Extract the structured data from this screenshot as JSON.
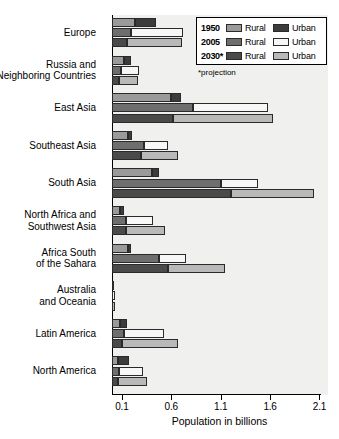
{
  "chart_data": {
    "type": "bar",
    "orientation": "horizontal",
    "title": "",
    "xlabel": "Population in billions",
    "ylabel": "",
    "xlim": [
      0.0,
      2.15
    ],
    "xticks": [
      0.1,
      0.6,
      1.1,
      1.6,
      2.1
    ],
    "xticklabels": [
      "0.1",
      "0.6",
      "1.1",
      "1.6",
      "2.1"
    ],
    "grid": false,
    "legend_position": "top-right",
    "stacked": true,
    "footnote": "*projection",
    "legend": {
      "rows": [
        {
          "year": "1950",
          "rural_label": "Rural",
          "urban_label": "Urban",
          "rural_color": "#9a9a9a",
          "urban_color": "#3c3c3c"
        },
        {
          "year": "2005",
          "rural_label": "Rural",
          "urban_label": "Urban",
          "rural_color": "#6e6e6e",
          "urban_color": "#f7f7f7"
        },
        {
          "year": "2030*",
          "rural_label": "Rural",
          "urban_label": "Urban",
          "rural_color": "#4a4a4a",
          "urban_color": "#b9b9b9"
        }
      ]
    },
    "categories": [
      "Europe",
      "Russia and Neighboring Countries",
      "East Asia",
      "Southeast Asia",
      "South Asia",
      "North Africa and Southwest Asia",
      "Africa South of the Sahara",
      "Australia and Oceania",
      "Latin America",
      "North America"
    ],
    "category_label_lines": [
      [
        "Europe"
      ],
      [
        "Russia and",
        "Neighboring Countries"
      ],
      [
        "East Asia"
      ],
      [
        "Southeast Asia"
      ],
      [
        "South Asia"
      ],
      [
        "North Africa and",
        "Southwest Asia"
      ],
      [
        "Africa South",
        "of the Sahara"
      ],
      [
        "Australia",
        "and Oceania"
      ],
      [
        "Latin America"
      ],
      [
        "North America"
      ]
    ],
    "series": [
      {
        "name": "1950 Rural",
        "year": "1950",
        "sector": "Rural",
        "color": "#9a9a9a",
        "values": [
          0.23,
          0.12,
          0.6,
          0.16,
          0.4,
          0.08,
          0.16,
          0.005,
          0.08,
          0.06
        ]
      },
      {
        "name": "1950 Urban",
        "year": "1950",
        "sector": "Urban",
        "color": "#3c3c3c",
        "values": [
          0.22,
          0.07,
          0.1,
          0.04,
          0.08,
          0.04,
          0.03,
          0.008,
          0.07,
          0.11
        ]
      },
      {
        "name": "2005 Rural",
        "year": "2005",
        "sector": "Rural",
        "color": "#6e6e6e",
        "values": [
          0.19,
          0.09,
          0.82,
          0.32,
          1.1,
          0.14,
          0.48,
          0.003,
          0.12,
          0.07
        ]
      },
      {
        "name": "2005 Urban",
        "year": "2005",
        "sector": "Urban",
        "color": "#f7f7f7",
        "values": [
          0.53,
          0.18,
          0.76,
          0.25,
          0.38,
          0.27,
          0.27,
          0.024,
          0.41,
          0.24
        ]
      },
      {
        "name": "2030 Rural",
        "year": "2030*",
        "sector": "Rural",
        "color": "#4a4a4a",
        "values": [
          0.15,
          0.07,
          0.62,
          0.29,
          1.2,
          0.14,
          0.57,
          0.003,
          0.1,
          0.06
        ]
      },
      {
        "name": "2030 Urban",
        "year": "2030*",
        "sector": "Urban",
        "color": "#b9b9b9",
        "values": [
          0.56,
          0.19,
          1.01,
          0.38,
          0.84,
          0.4,
          0.57,
          0.027,
          0.57,
          0.29
        ]
      }
    ],
    "totals": {
      "1950": [
        0.45,
        0.19,
        0.7,
        0.2,
        0.48,
        0.12,
        0.19,
        0.013,
        0.15,
        0.17
      ],
      "2005": [
        0.72,
        0.27,
        1.58,
        0.57,
        1.48,
        0.41,
        0.75,
        0.027,
        0.53,
        0.31
      ],
      "2030*": [
        0.71,
        0.26,
        1.63,
        0.67,
        2.04,
        0.54,
        1.14,
        0.03,
        0.67,
        0.35
      ]
    }
  }
}
